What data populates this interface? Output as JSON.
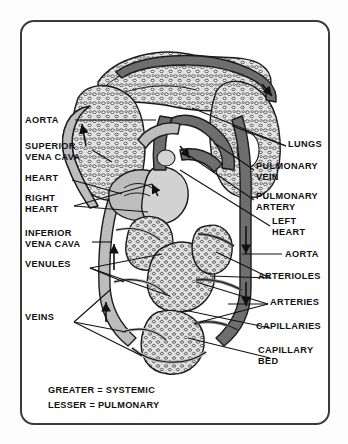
{
  "figure": {
    "frame": {
      "border_color": "#3a3a3a",
      "background": "#ffffff"
    }
  },
  "labels_left": [
    {
      "name": "aorta",
      "text": "AORTA",
      "x": 25,
      "y": 115
    },
    {
      "name": "superior-vena-cava",
      "text": "SUPERIOR\nVENA CAVA",
      "x": 25,
      "y": 141
    },
    {
      "name": "heart",
      "text": "HEART",
      "x": 25,
      "y": 173
    },
    {
      "name": "right-heart",
      "text": "RIGHT\nHEART",
      "x": 25,
      "y": 193
    },
    {
      "name": "inferior-vena-cava",
      "text": "INFERIOR\nVENA CAVA",
      "x": 25,
      "y": 228
    },
    {
      "name": "venules",
      "text": "VENULES",
      "x": 25,
      "y": 259
    },
    {
      "name": "veins",
      "text": "VEINS",
      "x": 25,
      "y": 312
    }
  ],
  "labels_right": [
    {
      "name": "lungs",
      "text": "LUNGS",
      "x": 288,
      "y": 139
    },
    {
      "name": "pulmonary-vein",
      "text": "PULMONARY\nVEIN",
      "x": 256,
      "y": 161
    },
    {
      "name": "pulmonary-artery",
      "text": "PULMONARY\nARTERY",
      "x": 256,
      "y": 191
    },
    {
      "name": "left-heart",
      "text": "LEFT\nHEART",
      "x": 272,
      "y": 216
    },
    {
      "name": "aorta-right",
      "text": "AORTA",
      "x": 285,
      "y": 249
    },
    {
      "name": "arterioles",
      "text": "ARTERIOLES",
      "x": 258,
      "y": 271
    },
    {
      "name": "arteries",
      "text": "ARTERIES",
      "x": 270,
      "y": 297
    },
    {
      "name": "capillaries",
      "text": "CAPILLARIES",
      "x": 256,
      "y": 321
    },
    {
      "name": "capillary-bed",
      "text": "CAPILLARY\nBED",
      "x": 258,
      "y": 345
    }
  ],
  "legend": {
    "x": 48,
    "y": 383,
    "lines": [
      {
        "name": "greater-systemic",
        "text": "GREATER = SYSTEMIC"
      },
      {
        "name": "lesser-pulmonary",
        "text": "LESSER = PULMONARY"
      }
    ]
  },
  "colors": {
    "ink": "#111111",
    "outline": "#1b1b1b",
    "vessel_dark": "#6e6e6e",
    "vessel_light": "#bdbdbd",
    "lung_fill": "#d9d9d9",
    "paper": "#ffffff"
  }
}
